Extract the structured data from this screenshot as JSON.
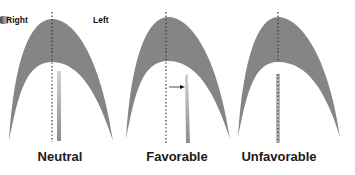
{
  "labels": {
    "right": "Right",
    "left": "Left"
  },
  "panels": [
    {
      "id": "neutral",
      "caption": "Neutral",
      "implant": "straight",
      "arrow": false
    },
    {
      "id": "favorable",
      "caption": "Favorable",
      "implant": "tilted-right",
      "arrow": true
    },
    {
      "id": "unfavorable",
      "caption": "Unfavorable",
      "implant": "dotted-on-midline",
      "arrow": false
    }
  ],
  "colors": {
    "arch": "#858585",
    "implant_light": "#c9c9c9",
    "implant_dark": "#8a8a8a",
    "midline": "#333333",
    "text": "#1a1a1a"
  }
}
